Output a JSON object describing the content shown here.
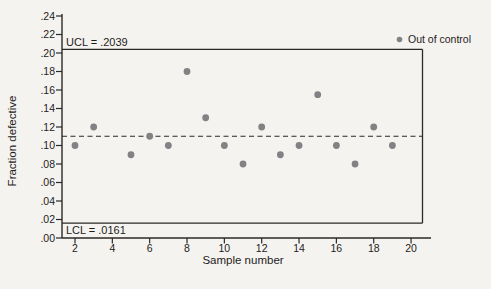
{
  "figure": {
    "kind": "p-control-chart",
    "background_color": "#f5f3f0"
  },
  "chart_data": {
    "type": "scatter",
    "title": "",
    "xlabel": "Sample number",
    "ylabel": "Fraction defective",
    "x": [
      2,
      3,
      5,
      6,
      7,
      8,
      9,
      10,
      11,
      12,
      13,
      14,
      15,
      16,
      17,
      18,
      19
    ],
    "y": [
      0.1,
      0.12,
      0.09,
      0.11,
      0.1,
      0.18,
      0.13,
      0.1,
      0.08,
      0.12,
      0.09,
      0.1,
      0.155,
      0.1,
      0.08,
      0.12,
      0.1
    ],
    "ucl": {
      "label": "UCL = .2039",
      "value": 0.2039
    },
    "lcl": {
      "label": "LCL = .0161",
      "value": 0.0161
    },
    "center_line": {
      "value": 0.11,
      "style": "dashed"
    },
    "legend": {
      "position": "top-right",
      "entries": [
        {
          "label": "Out of control",
          "marker": "dot"
        }
      ]
    },
    "xlim": [
      1,
      21
    ],
    "ylim": [
      0,
      0.24
    ],
    "xticks": [
      2,
      4,
      6,
      8,
      10,
      12,
      14,
      16,
      18,
      20
    ],
    "ytick_step": 0.02,
    "ytick_labels": [
      ".00",
      ".02",
      ".04",
      ".06",
      ".08",
      ".10",
      ".12",
      ".14",
      ".16",
      ".18",
      ".20",
      ".22",
      ".24"
    ],
    "grid": "off",
    "colors": {
      "point": "#828284",
      "line": "#2b2926",
      "text": "#1d1c1a",
      "background": "#f5f3f0"
    }
  }
}
